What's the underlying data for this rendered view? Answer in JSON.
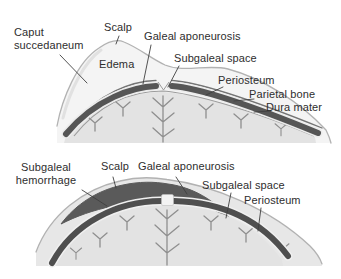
{
  "page": {
    "background": "#ffffff"
  },
  "colors": {
    "outline": "#b2b2b2",
    "scalp_fill_top": "#f4f4f4",
    "scalp_fill_bottom": "#e7e7e7",
    "bone_band": "#555555",
    "hemorrhage": "#5a5a5a",
    "brain": "#e3e3e3",
    "vessel": "#8f8f8f",
    "leader_line": "#3f3f3f",
    "label_text": "#2e2e2e"
  },
  "top_panel": {
    "labels": {
      "caput_succedaneum": "Caput\nsuccedaneum",
      "scalp": "Scalp",
      "galeal_aponeurosis": "Galeal aponeurosis",
      "edema": "Edema",
      "subgaleal_space": "Subgaleal space",
      "periosteum": "Periosteum",
      "parietal_bone": "Parietal bone",
      "dura_mater": "Dura mater"
    }
  },
  "bottom_panel": {
    "labels": {
      "subgaleal_hemorrhage": "Subgaleal\nhemorrhage",
      "scalp": "Scalp",
      "galeal_aponeurosis": "Galeal aponeurosis",
      "subgaleal_space": "Subgaleal space",
      "periosteum": "Periosteum"
    }
  }
}
